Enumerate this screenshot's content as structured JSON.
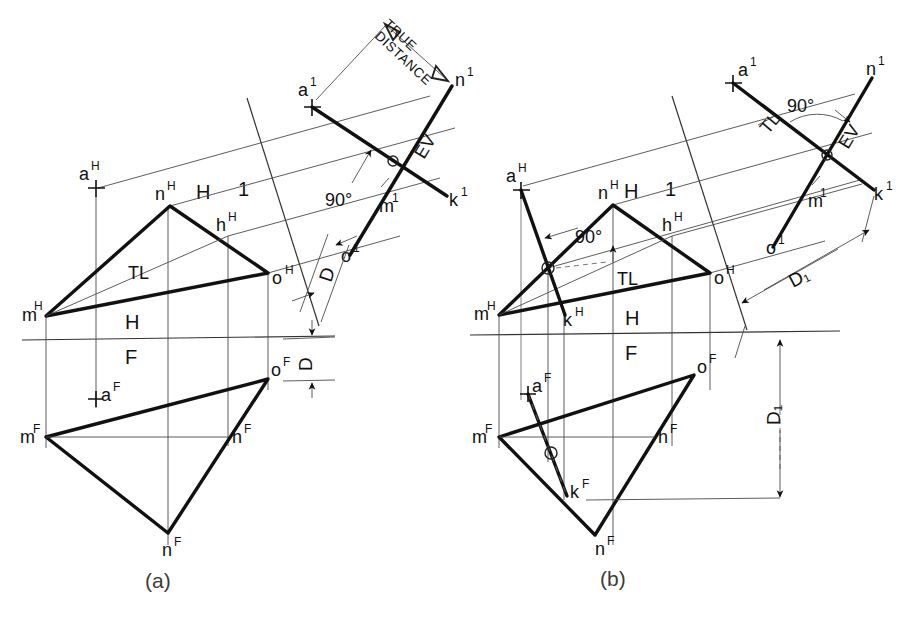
{
  "figure": {
    "title_caption_a": "(a)",
    "title_caption_b": "(b)",
    "background": "#ffffff",
    "line_color": "#111111"
  },
  "labels": {
    "true_distance_line1": "TRUE",
    "true_distance_line2": "DISTANCE",
    "angle_90": "90°",
    "edge_view": "EV",
    "true_length": "TL",
    "fold_h": "H",
    "fold_f": "F",
    "fold_1": "1",
    "dim_d": "D",
    "dim_d1": "D₁"
  },
  "fig_a": {
    "top_view": {
      "points": [
        {
          "name": "m-top",
          "label_main": "m",
          "label_sup": "H",
          "x": 46,
          "y": 316
        },
        {
          "name": "n-top",
          "label_main": "n",
          "label_sup": "H",
          "x": 170,
          "y": 206
        },
        {
          "name": "o-top",
          "label_main": "o",
          "label_sup": "H",
          "x": 268,
          "y": 273
        },
        {
          "name": "h-top",
          "label_main": "h",
          "label_sup": "H",
          "x": 228,
          "y": 236
        },
        {
          "name": "a-top",
          "label_main": "a",
          "label_sup": "H",
          "x": 96,
          "y": 184
        }
      ],
      "tl_label": "TL"
    },
    "front_view": {
      "points": [
        {
          "name": "m-front",
          "label_main": "m",
          "label_sup": "F",
          "x": 46,
          "y": 437
        },
        {
          "name": "n-front",
          "label_main": "n",
          "label_sup": "F",
          "x": 168,
          "y": 533
        },
        {
          "name": "o-front",
          "label_main": "o",
          "label_sup": "F",
          "x": 268,
          "y": 379
        },
        {
          "name": "h-front",
          "label_main": "h",
          "label_sup": "F",
          "x": 228,
          "y": 437
        },
        {
          "name": "a-front",
          "label_main": "a",
          "label_sup": "F",
          "x": 96,
          "y": 396
        }
      ]
    },
    "aux_view": {
      "points": [
        {
          "name": "a-aux",
          "label_main": "a",
          "label_sup": "1",
          "x": 312,
          "y": 106
        },
        {
          "name": "n-aux",
          "label_main": "n",
          "label_sup": "1",
          "x": 452,
          "y": 86
        },
        {
          "name": "k-aux",
          "label_main": "k",
          "label_sup": "1",
          "x": 447,
          "y": 199
        },
        {
          "name": "m-aux",
          "label_main": "m",
          "label_sup": "1",
          "x": 393,
          "y": 204
        },
        {
          "name": "o-aux",
          "label_main": "o",
          "label_sup": "1",
          "x": 350,
          "y": 255
        }
      ]
    },
    "fold_h1_label_h": "H",
    "fold_h1_label_1": "1",
    "fold_hf_label_h": "H",
    "fold_hf_label_f": "F"
  },
  "fig_b": {
    "top_view": {
      "points": [
        {
          "name": "m-top",
          "label_main": "m",
          "label_sup": "H",
          "x": 499,
          "y": 315
        },
        {
          "name": "n-top",
          "label_main": "n",
          "label_sup": "H",
          "x": 613,
          "y": 205
        },
        {
          "name": "o-top",
          "label_main": "o",
          "label_sup": "H",
          "x": 710,
          "y": 273
        },
        {
          "name": "h-top",
          "label_main": "h",
          "label_sup": "H",
          "x": 672,
          "y": 236
        },
        {
          "name": "a-top",
          "label_main": "a",
          "label_sup": "H",
          "x": 521,
          "y": 183
        },
        {
          "name": "k-top",
          "label_main": "k",
          "label_sup": "H",
          "x": 564,
          "y": 313
        },
        {
          "name": "q-top",
          "label_main": "",
          "label_sup": "",
          "x": 548,
          "y": 268
        }
      ],
      "tl_label": "TL",
      "angle_label": "90°"
    },
    "front_view": {
      "points": [
        {
          "name": "m-front",
          "label_main": "m",
          "label_sup": "F",
          "x": 499,
          "y": 437
        },
        {
          "name": "n-front",
          "label_main": "n",
          "label_sup": "F",
          "x": 595,
          "y": 535
        },
        {
          "name": "o-front",
          "label_main": "o",
          "label_sup": "F",
          "x": 694,
          "y": 375
        },
        {
          "name": "h-front",
          "label_main": "h",
          "label_sup": "F",
          "x": 655,
          "y": 437
        },
        {
          "name": "a-front",
          "label_main": "a",
          "label_sup": "F",
          "x": 528,
          "y": 390
        },
        {
          "name": "k-front",
          "label_main": "k",
          "label_sup": "F",
          "x": 568,
          "y": 492
        },
        {
          "name": "q-front",
          "label_main": "",
          "label_sup": "",
          "x": 551,
          "y": 453
        }
      ]
    },
    "aux_view": {
      "points": [
        {
          "name": "a-aux",
          "label_main": "a",
          "label_sup": "1",
          "x": 733,
          "y": 84
        },
        {
          "name": "n-aux",
          "label_main": "n",
          "label_sup": "1",
          "x": 872,
          "y": 78
        },
        {
          "name": "k-aux",
          "label_main": "k",
          "label_sup": "1",
          "x": 874,
          "y": 192
        },
        {
          "name": "m-aux",
          "label_main": "m",
          "label_sup": "1",
          "x": 821,
          "y": 199
        },
        {
          "name": "o-aux",
          "label_main": "o",
          "label_sup": "1",
          "x": 775,
          "y": 247
        }
      ],
      "tl_label": "TL",
      "angle_label": "90°",
      "ev_label": "EV"
    },
    "fold_h1_label_h": "H",
    "fold_h1_label_1": "1",
    "fold_hf_label_h": "H",
    "fold_hf_label_f": "F",
    "dim_aux": "D₁",
    "dim_front": "D₁"
  }
}
